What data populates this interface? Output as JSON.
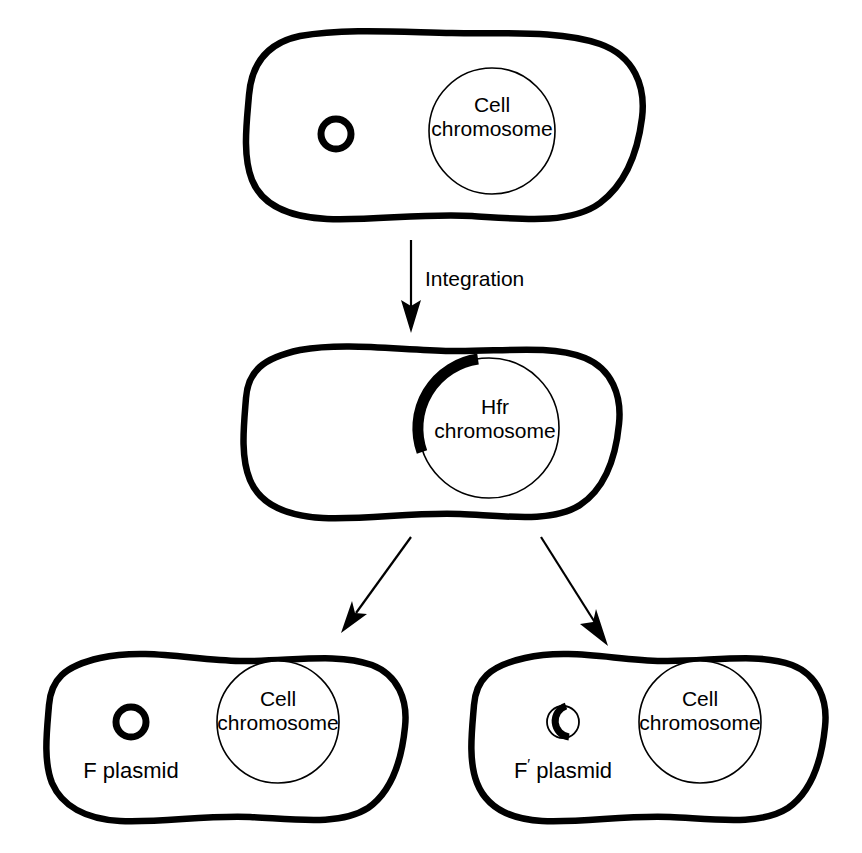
{
  "figure": {
    "background_color": "#ffffff",
    "ink_color": "#000000"
  },
  "steps": {
    "integration_label": "Integration"
  },
  "cells": [
    {
      "id": "f-plus-cell",
      "role": "top",
      "nucleoid_label_line1": "Cell",
      "nucleoid_label_line2": "chromosome",
      "plasmid_label": "",
      "plasmid_type": "closed-ring"
    },
    {
      "id": "hfr-cell",
      "role": "middle",
      "nucleoid_label_line1": "Hfr",
      "nucleoid_label_line2": "chromosome",
      "plasmid_label": "",
      "plasmid_type": "integrated-arc"
    },
    {
      "id": "f-plasmid-cell",
      "role": "bottom-left",
      "nucleoid_label_line1": "Cell",
      "nucleoid_label_line2": "chromosome",
      "plasmid_label": "F plasmid",
      "plasmid_type": "closed-ring"
    },
    {
      "id": "f-prime-plasmid-cell",
      "role": "bottom-right",
      "nucleoid_label_line1": "Cell",
      "nucleoid_label_line2": "chromosome",
      "plasmid_label_base": "F",
      "plasmid_label_prime": "′",
      "plasmid_label_rest": "plasmid",
      "plasmid_type": "hybrid-ring"
    }
  ],
  "icons": {
    "down_arrow": "arrow-down-icon",
    "branch_left_arrow": "arrow-down-left-icon",
    "branch_right_arrow": "arrow-down-right-icon"
  }
}
